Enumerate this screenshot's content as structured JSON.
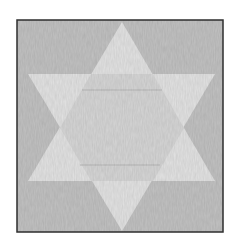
{
  "figure": {
    "type": "hexagram",
    "colors": {
      "page_background": "#ffffff",
      "frame_background": "#c2c2c2",
      "frame_border": "#2e2e2e",
      "star_fill": "#e3e3e3",
      "inner_hexagon_fill": "#d6d6d6",
      "inner_lines": "#b8b8b8"
    },
    "frame": {
      "x": 17,
      "y": 20,
      "width": 206,
      "height": 212
    },
    "up_triangle": {
      "apex": [
        122,
        22
      ],
      "base_left": [
        28,
        181
      ],
      "base_right": [
        215,
        181
      ]
    },
    "down_triangle": {
      "apex": [
        122,
        231
      ],
      "base_left": [
        28,
        74
      ],
      "base_right": [
        215,
        74
      ]
    }
  }
}
